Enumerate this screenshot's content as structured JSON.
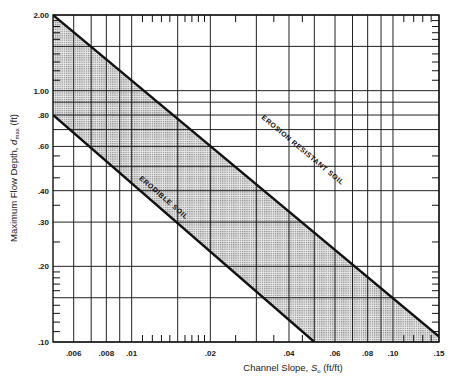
{
  "chart_data": {
    "type": "area",
    "title": "",
    "xlabel": "Channel Slope, S_o (ft/ft)",
    "xlabel_parts": {
      "prefix": "Channel Slope, ",
      "symbol": "S",
      "subscript": "o",
      "suffix": " (ft/ft)"
    },
    "ylabel": "Maximum Flow Depth, d_max (ft)",
    "ylabel_parts": {
      "prefix": "Maximum Flow Depth, ",
      "symbol": "d",
      "subscript": "max",
      "suffix": " (ft)"
    },
    "x_scale": "log",
    "y_scale": "log",
    "xlim": [
      0.005,
      0.15
    ],
    "ylim": [
      0.1,
      2.0
    ],
    "grid": true,
    "x_ticks": [
      {
        "value": 0.006,
        "label": ".006"
      },
      {
        "value": 0.008,
        "label": ".008"
      },
      {
        "value": 0.01,
        "label": ".01"
      },
      {
        "value": 0.02,
        "label": ".02"
      },
      {
        "value": 0.04,
        "label": ".04"
      },
      {
        "value": 0.06,
        "label": ".06"
      },
      {
        "value": 0.08,
        "label": ".08"
      },
      {
        "value": 0.1,
        "label": ".10"
      },
      {
        "value": 0.15,
        "label": ".15"
      }
    ],
    "y_ticks": [
      {
        "value": 2.0,
        "label": "2.00"
      },
      {
        "value": 1.0,
        "label": "1.00"
      },
      {
        "value": 0.8,
        "label": ".80"
      },
      {
        "value": 0.6,
        "label": ".60"
      },
      {
        "value": 0.4,
        "label": ".40"
      },
      {
        "value": 0.3,
        "label": ".30"
      },
      {
        "value": 0.2,
        "label": ".20"
      },
      {
        "value": 0.1,
        "label": ".10"
      }
    ],
    "x_gridlines": [
      0.006,
      0.007,
      0.008,
      0.009,
      0.01,
      0.015,
      0.02,
      0.03,
      0.04,
      0.05,
      0.06,
      0.07,
      0.08,
      0.09,
      0.1,
      0.15
    ],
    "y_gridlines": [
      0.1,
      0.15,
      0.2,
      0.3,
      0.4,
      0.5,
      0.6,
      0.7,
      0.8,
      0.9,
      1.0,
      1.5,
      2.0
    ],
    "series": [
      {
        "name": "EROSION RESISTANT SOIL",
        "type": "line",
        "x": [
          0.005,
          0.15
        ],
        "y": [
          2.0,
          0.105
        ]
      },
      {
        "name": "ERODIBLE SOIL",
        "type": "line",
        "x": [
          0.005,
          0.05
        ],
        "y": [
          0.8,
          0.1
        ]
      }
    ],
    "shaded_region": {
      "description": "Stippled band between ERODIBLE SOIL and EROSION RESISTANT SOIL lines",
      "fill": "#c8c8c8"
    },
    "annotations": [
      {
        "text": "EROSION RESISTANT SOIL",
        "x": 0.045,
        "y": 0.55
      },
      {
        "text": "ERODIBLE SOIL",
        "x": 0.012,
        "y": 0.42
      }
    ]
  },
  "colors": {
    "line": "#111111",
    "grid": "#222222",
    "shade": "#c9c9c9",
    "background": "#ffffff"
  }
}
